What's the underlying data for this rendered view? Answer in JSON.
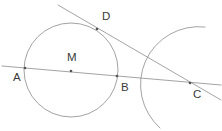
{
  "figure": {
    "background_color": "#ffffff",
    "stroke_color": "#8c8c8c",
    "label_color": "#3a3a3a",
    "point_color": "#555555",
    "stroke_width": 0.8,
    "width": 222,
    "height": 131
  },
  "labels": {
    "A": "A",
    "B": "B",
    "C": "C",
    "D": "D",
    "M": "M"
  },
  "points": {
    "A": {
      "x": 25,
      "y": 68,
      "label_x": 13,
      "label_y": 78
    },
    "B": {
      "x": 117,
      "y": 76,
      "label_x": 121,
      "label_y": 88
    },
    "C": {
      "x": 190,
      "y": 83,
      "label_x": 193,
      "label_y": 95
    },
    "D": {
      "x": 97,
      "y": 29,
      "label_x": 102,
      "label_y": 17
    },
    "M": {
      "x": 71,
      "y": 71,
      "label_x": 67,
      "label_y": 58
    }
  },
  "circle": {
    "name": "main-circle",
    "center_x": 71,
    "center_y": 70,
    "radius": 47
  },
  "arc": {
    "name": "arc-centered-at-c",
    "start_x": 205,
    "start_y": 27,
    "end_x": 160,
    "end_y": 128,
    "radius": 58,
    "sweep": 0,
    "large_arc": 0
  },
  "lines": [
    {
      "name": "line-a-to-c",
      "x1": 2,
      "y1": 66,
      "x2": 221,
      "y2": 85
    },
    {
      "name": "tangent-line-d-to-c",
      "x1": 58,
      "y1": 5,
      "x2": 221,
      "y2": 100
    }
  ],
  "chart_data": {
    "type": "diagram",
    "elements": [
      {
        "kind": "circle",
        "id": "main-circle",
        "center": "M",
        "radius_px": 47
      },
      {
        "kind": "point",
        "id": "A",
        "on": "circle",
        "position": "left"
      },
      {
        "kind": "point",
        "id": "B",
        "on": "circle",
        "position": "right"
      },
      {
        "kind": "point",
        "id": "M",
        "role": "center"
      },
      {
        "kind": "point",
        "id": "D",
        "on": "circle",
        "role": "tangency-point"
      },
      {
        "kind": "point",
        "id": "C",
        "role": "external-point"
      },
      {
        "kind": "line",
        "id": "line-a-to-c",
        "through": [
          "A",
          "M",
          "B",
          "C"
        ]
      },
      {
        "kind": "line",
        "id": "tangent-line-d-to-c",
        "through": [
          "D",
          "C"
        ]
      },
      {
        "kind": "arc",
        "id": "arc-centered-at-c",
        "center": "C"
      }
    ]
  }
}
